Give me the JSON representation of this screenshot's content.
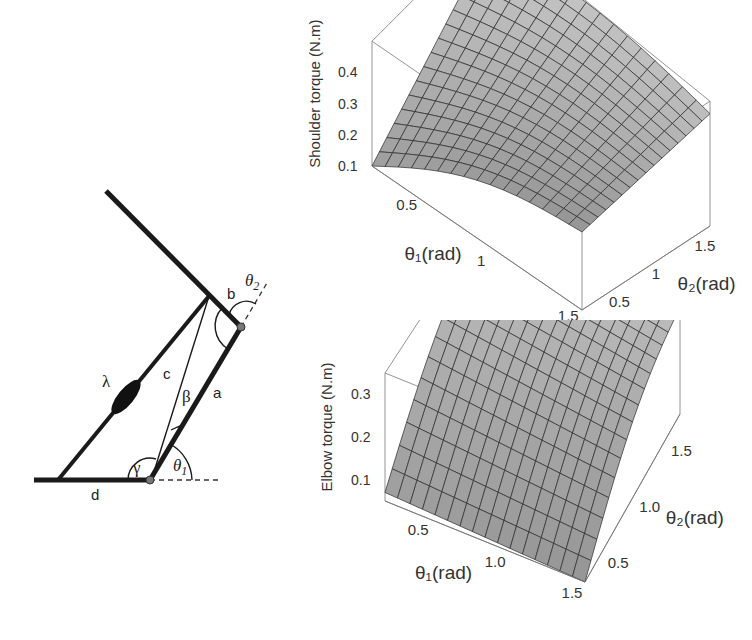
{
  "diagram": {
    "labels": {
      "a": "a",
      "b": "b",
      "c": "c",
      "d": "d",
      "lambda": "λ",
      "beta": "β",
      "gamma": "γ",
      "theta1": "θ",
      "theta1_sub": "1",
      "theta2": "θ",
      "theta2_sub": "2"
    }
  },
  "chart_data": [
    {
      "type": "surface3d",
      "title": "",
      "zlabel": "Shoulder torque (N.m)",
      "xlabel": "θ1(rad)",
      "ylabel": "θ2(rad)",
      "x_ticks": [
        "0.5",
        "1",
        "1.5"
      ],
      "y_ticks": [
        "0.5",
        "1",
        "1.5"
      ],
      "z_ticks": [
        "0.1",
        "0.2",
        "0.3",
        "0.4"
      ],
      "xlim": [
        0.3,
        1.6
      ],
      "ylim": [
        0.3,
        1.8
      ],
      "zlim": [
        0.1,
        0.5
      ],
      "grid_lines": 16,
      "surface_color": "#9a9a9a",
      "corner_values": {
        "x_min_y_min": 0.1,
        "x_max_y_min": 0.35,
        "x_min_y_max": 0.45,
        "x_max_y_max": 0.46
      },
      "description": "Shoulder torque rises from ~0.1 at small θ1, small θ2 to ~0.45 at large θ2; concave in θ1"
    },
    {
      "type": "surface3d",
      "title": "",
      "zlabel": "Elbow torque (N.m)",
      "xlabel": "θ1(rad)",
      "ylabel": "θ2(rad)",
      "x_ticks": [
        "0.5",
        "1.0",
        "1.5"
      ],
      "y_ticks": [
        "0.5",
        "1.0",
        "1.5"
      ],
      "z_ticks": [
        "0.1",
        "0.2",
        "0.3"
      ],
      "xlim": [
        0.3,
        1.6
      ],
      "ylim": [
        0.3,
        1.8
      ],
      "zlim": [
        0.05,
        0.35
      ],
      "grid_lines": 16,
      "surface_color": "#8c8c8c",
      "corner_values": {
        "x_min_y_min": 0.09,
        "x_max_y_min": 0.07,
        "x_min_y_max": 0.34,
        "x_max_y_max": 0.3
      },
      "description": "Elbow torque increases strongly with θ2 (concave), weakly dependent on θ1"
    }
  ]
}
